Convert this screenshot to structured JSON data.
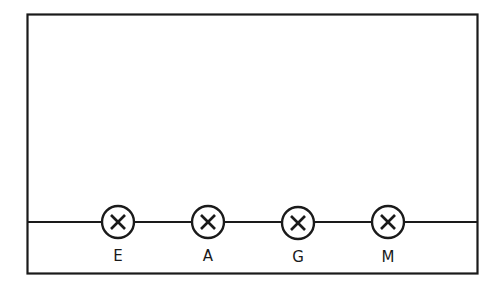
{
  "diagram": {
    "type": "circuit",
    "stroke_color": "#1a1a1a",
    "background": "#ffffff",
    "lamps": [
      {
        "label": "E",
        "symbol": "lamp-icon"
      },
      {
        "label": "A",
        "symbol": "lamp-icon"
      },
      {
        "label": "G",
        "symbol": "lamp-icon"
      },
      {
        "label": "M",
        "symbol": "lamp-icon"
      }
    ]
  }
}
